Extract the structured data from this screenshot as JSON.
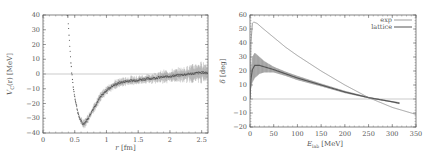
{
  "chart_data": [
    {
      "type": "line",
      "title": "",
      "xlabel": "r [fm]",
      "ylabel": "V_C(r) [MeV]",
      "xlim": [
        0,
        2.6
      ],
      "ylim": [
        -40,
        40
      ],
      "xticks": [
        "0",
        "0.5",
        "1",
        "1.5",
        "2",
        "2.5"
      ],
      "yticks": [
        "-40",
        "-30",
        "-20",
        "-10",
        "0",
        "10",
        "20",
        "30",
        "40"
      ],
      "grid": false,
      "legend": null,
      "series": [
        {
          "name": "potential",
          "style": "points with error bars",
          "x": [
            0.39,
            0.42,
            0.45,
            0.48,
            0.52,
            0.56,
            0.6,
            0.63,
            0.66,
            0.7,
            0.75,
            0.8,
            0.9,
            1.0,
            1.1,
            1.2,
            1.3,
            1.5,
            1.7,
            1.9,
            2.1,
            2.3,
            2.5,
            2.6
          ],
          "values": [
            40,
            20,
            2,
            -10,
            -20,
            -28,
            -32,
            -34,
            -33,
            -31,
            -27,
            -23,
            -16,
            -11,
            -8,
            -6,
            -5,
            -4,
            -3,
            -2,
            -1,
            0,
            1,
            1
          ],
          "error": [
            0,
            0,
            0.5,
            0.5,
            1,
            1,
            1.5,
            2,
            2,
            2,
            2,
            2,
            2,
            2,
            2,
            2,
            2,
            2,
            2,
            3,
            3,
            4,
            5,
            5
          ]
        }
      ],
      "annotations": [
        "horizontal line at y=0"
      ]
    },
    {
      "type": "line",
      "title": "",
      "xlabel": "E_lab [MeV]",
      "ylabel": "δ [deg]",
      "xlim": [
        0,
        350
      ],
      "ylim": [
        -20,
        60
      ],
      "xticks": [
        "0",
        "50",
        "100",
        "150",
        "200",
        "250",
        "300",
        "350"
      ],
      "yticks": [
        "-20",
        "-10",
        "0",
        "10",
        "20",
        "30",
        "40",
        "50",
        "60"
      ],
      "grid": false,
      "legend": {
        "position": "upper right",
        "entries": [
          "exp",
          "lattice"
        ]
      },
      "series": [
        {
          "name": "exp",
          "x": [
            0,
            2,
            5,
            8,
            15,
            25,
            50,
            75,
            100,
            150,
            200,
            250,
            300,
            350
          ],
          "values": [
            0,
            40,
            54,
            55,
            54,
            51,
            44,
            37,
            31,
            20,
            10,
            1,
            -6,
            -11
          ]
        },
        {
          "name": "lattice",
          "x": [
            0,
            2,
            5,
            10,
            20,
            30,
            50,
            75,
            100,
            150,
            200,
            250,
            300,
            315
          ],
          "values": [
            0,
            14,
            21,
            24,
            24,
            23,
            21,
            18,
            15,
            10,
            5,
            1,
            -2,
            -3
          ],
          "band_upper": [
            0,
            20,
            30,
            33,
            30,
            27,
            23,
            19.5,
            16.5,
            11,
            5.8,
            1.5,
            -1.5,
            -2.3
          ],
          "band_lower": [
            0,
            8,
            12,
            15,
            18,
            19,
            19,
            16.5,
            13.5,
            9,
            4.2,
            0.5,
            -2.5,
            -3.7
          ]
        }
      ],
      "annotations": [
        "horizontal line at y=0"
      ]
    }
  ],
  "left": {
    "ylabel_main": "V",
    "ylabel_sub": "C",
    "ylabel_rest": "(r) [MeV]",
    "xlabel_main": "r",
    "xlabel_rest": " [fm]"
  },
  "right": {
    "ylabel_main": "δ",
    "ylabel_rest": " [deg]",
    "xlabel_main": "E",
    "xlabel_sub": "lab",
    "xlabel_rest": " [MeV]",
    "legend_exp": "exp",
    "legend_lattice": "lattice"
  },
  "colors": {
    "axis": "#666666",
    "exp_line": "#777777",
    "lattice_line": "#555555",
    "band": "#8a8a8a",
    "points": "#444444",
    "errorbars": "#999999"
  }
}
